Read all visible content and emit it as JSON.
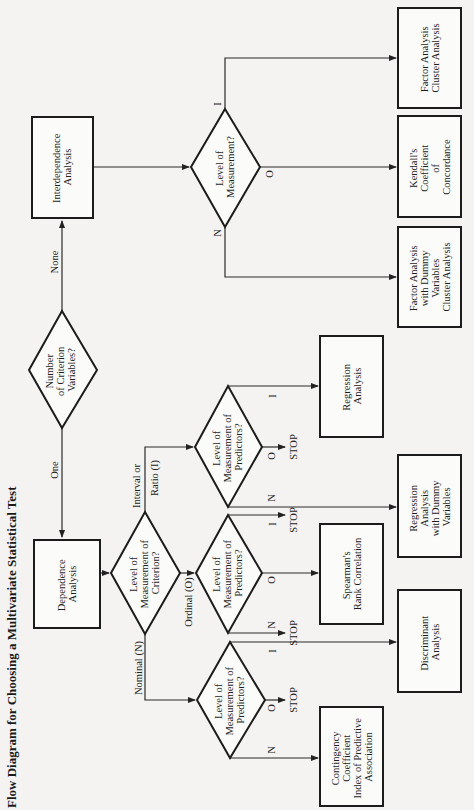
{
  "title": "Flow Diagram for Choosing a Multivariate Statistical Test",
  "nodes": {
    "start": {
      "type": "decision",
      "lines": [
        "Number",
        "of Criterion",
        "Variables?"
      ]
    },
    "dependence": {
      "type": "process",
      "lines": [
        "Dependence",
        "Analysis"
      ]
    },
    "interdependence": {
      "type": "process",
      "lines": [
        "Interdependence",
        "Analysis"
      ]
    },
    "criterion_level": {
      "type": "decision",
      "lines": [
        "Level of",
        "Measurement of",
        "Criterion?"
      ]
    },
    "pred_nominal": {
      "type": "decision",
      "lines": [
        "Level of",
        "Measurement of",
        "Predictors?"
      ]
    },
    "pred_ordinal": {
      "type": "decision",
      "lines": [
        "Level of",
        "Measurement of",
        "Predictors?"
      ]
    },
    "pred_interval": {
      "type": "decision",
      "lines": [
        "Level of",
        "Measurement of",
        "Predictors?"
      ]
    },
    "interdep_level": {
      "type": "decision",
      "lines": [
        "Level of",
        "Measurement?"
      ]
    },
    "contingency": {
      "type": "result",
      "lines": [
        "Contingency",
        "Coefficient",
        "Index of Predictive",
        "Association"
      ]
    },
    "discriminant": {
      "type": "result",
      "lines": [
        "Discriminant",
        "Analysis"
      ]
    },
    "spearman": {
      "type": "result",
      "lines": [
        "Spearman's",
        "Rank Correlation"
      ]
    },
    "regression_dummy": {
      "type": "result",
      "lines": [
        "Regression",
        "Analysis",
        "with Dummy",
        "Variables"
      ]
    },
    "regression": {
      "type": "result",
      "lines": [
        "Regression",
        "Analysis"
      ]
    },
    "factor_dummy": {
      "type": "result",
      "lines": [
        "Factor Analysis",
        "with Dummy",
        "Variables",
        "Cluster Analysis"
      ]
    },
    "kendall": {
      "type": "result",
      "lines": [
        "Kendall's",
        "Coefficient",
        "of",
        "Concordance"
      ]
    },
    "factor_cluster": {
      "type": "result",
      "lines": [
        "Factor Analysis",
        "Cluster Analysis"
      ]
    }
  },
  "edge_labels": {
    "one": "One",
    "none": "None",
    "nominal": "Nominal (N)",
    "ordinal": "Ordinal (O)",
    "interval_1": "Interval or",
    "interval_2": "Ratio (I)",
    "n": "N",
    "o": "O",
    "i": "I",
    "stop": "STOP"
  },
  "colors": {
    "background": "#f4f3f1",
    "stroke": "#1c1c1c",
    "text": "#1d1d1d"
  }
}
